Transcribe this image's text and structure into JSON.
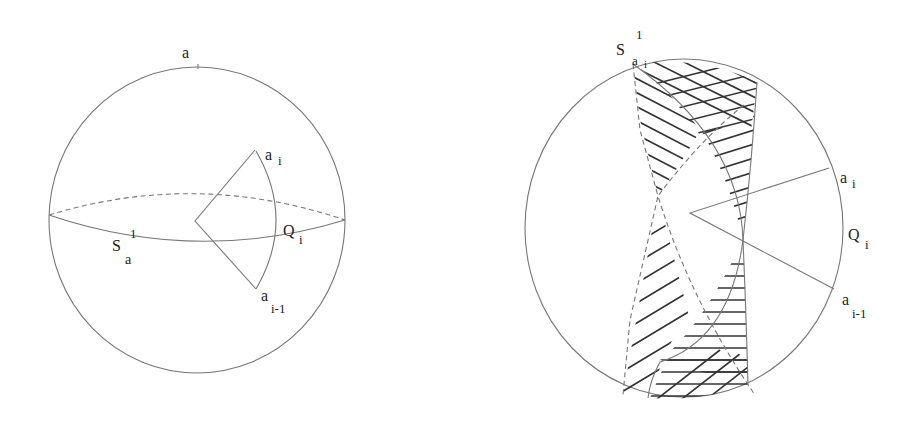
{
  "figure": {
    "left_panel": {
      "description": "Sphere with great circle S_a^1 (equator) and a spherical sector from center to arc a_i .. a_{i-1} crossing the equator at Q_i",
      "labels": {
        "top_point": {
          "base": "a",
          "sub": ""
        },
        "circle": {
          "base": "S",
          "sup": "1",
          "sub": "a"
        },
        "upper_vertex": {
          "base": "a",
          "sub": "i"
        },
        "lower_vertex": {
          "base": "a",
          "sub": "i-1"
        },
        "arc": {
          "base": "Q",
          "sub": "i"
        }
      }
    },
    "right_panel": {
      "description": "Sphere with great circle S_{a_i}^1 through a_i; hatched lune regions and sector from center to a_i, a_{i-1} with arc Q_i",
      "labels": {
        "circle": {
          "base": "S",
          "sup": "1",
          "sub": "a",
          "subsub": "i"
        },
        "upper_vertex": {
          "base": "a",
          "sub": "i"
        },
        "lower_vertex": {
          "base": "a",
          "sub": "i-1"
        },
        "arc": {
          "base": "Q",
          "sub": "i"
        }
      }
    }
  },
  "colors": {
    "line": "#777777",
    "hatch": "#333333",
    "text": "#222222",
    "background": "#ffffff"
  }
}
